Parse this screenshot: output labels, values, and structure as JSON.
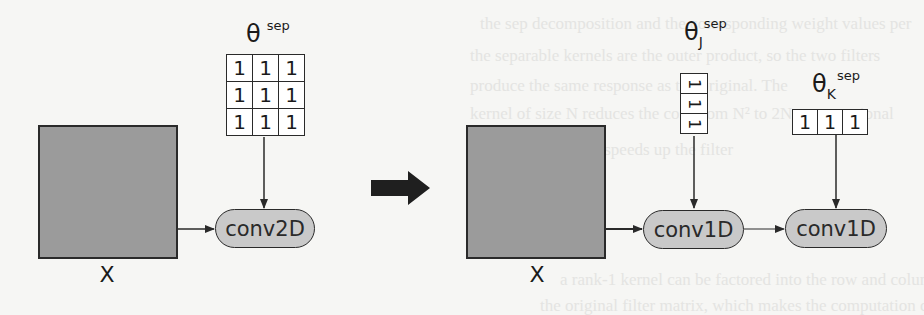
{
  "diagram": {
    "left": {
      "input_label": "X",
      "kernel": {
        "symbol": "θ",
        "subscript": "",
        "superscript": "sep",
        "values": [
          [
            "1",
            "1",
            "1"
          ],
          [
            "1",
            "1",
            "1"
          ],
          [
            "1",
            "1",
            "1"
          ]
        ]
      },
      "operation": "conv2D"
    },
    "transform_arrow": "right-arrow",
    "right": {
      "input_label": "X",
      "kernel_j": {
        "symbol": "θ",
        "subscript": "J",
        "superscript": "sep",
        "values": [
          "1",
          "1",
          "1"
        ]
      },
      "kernel_k": {
        "symbol": "θ",
        "subscript": "K",
        "superscript": "sep",
        "values": [
          "1",
          "1",
          "1"
        ]
      },
      "operation_1": "conv1D",
      "operation_2": "conv1D"
    }
  },
  "colors": {
    "background": "#f6f6f4",
    "input_fill": "#9b9b9b",
    "pill_fill": "#c9c9c9",
    "stroke": "#2a2a2a"
  }
}
